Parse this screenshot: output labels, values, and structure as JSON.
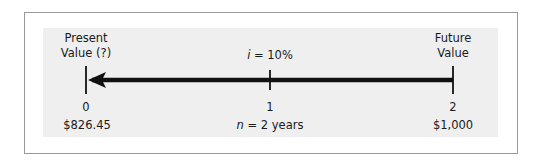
{
  "diagram": {
    "left_label_line1": "Present",
    "left_label_line2": "Value (?)",
    "right_label_line1": "Future",
    "right_label_line2": "Value",
    "rate_var": "i",
    "rate_rest": " = 10%",
    "periods": [
      "0",
      "1",
      "2"
    ],
    "present_value": "$826.45",
    "future_value": "$1,000",
    "n_var": "n",
    "n_rest": " = 2 years",
    "arrow_direction": "right-to-left",
    "colors": {
      "line": "#111111",
      "panel": "#efefef",
      "frame": "#9a9a9a"
    }
  }
}
